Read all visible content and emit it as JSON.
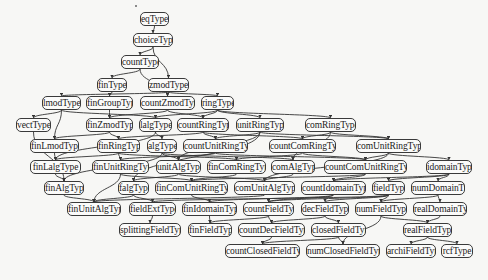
{
  "diagram": {
    "title": "",
    "style": {
      "background": "#f7f7f5",
      "node_border": "#3a3a3a",
      "edge_color": "#333333",
      "text_color": "#222222"
    },
    "nodes": [
      {
        "id": "eqType",
        "label": "eqType",
        "x": 140,
        "y": 12,
        "w": 29
      },
      {
        "id": "choiceType",
        "label": "choiceType",
        "x": 133,
        "y": 33,
        "w": 40
      },
      {
        "id": "countType",
        "label": "countType",
        "x": 121,
        "y": 55,
        "w": 38
      },
      {
        "id": "finType",
        "label": "finType",
        "x": 97,
        "y": 78,
        "w": 30
      },
      {
        "id": "zmodType",
        "label": "zmodType",
        "x": 148,
        "y": 78,
        "w": 41
      },
      {
        "id": "lmodType",
        "label": "lmodType",
        "x": 42,
        "y": 96,
        "w": 39
      },
      {
        "id": "finGroupType",
        "label": "finGroupType",
        "x": 86,
        "y": 96,
        "w": 47
      },
      {
        "id": "countZmodType",
        "label": "countZmodType",
        "x": 140,
        "y": 96,
        "w": 55
      },
      {
        "id": "ringType",
        "label": "ringType",
        "x": 201,
        "y": 96,
        "w": 33
      },
      {
        "id": "vectType",
        "label": "vectType",
        "x": 16,
        "y": 118,
        "w": 35
      },
      {
        "id": "finZmodType",
        "label": "finZmodType",
        "x": 86,
        "y": 118,
        "w": 47
      },
      {
        "id": "lalgType",
        "label": "lalgType",
        "x": 139,
        "y": 118,
        "w": 33
      },
      {
        "id": "countRingType",
        "label": "countRingType",
        "x": 177,
        "y": 118,
        "w": 52
      },
      {
        "id": "unitRingType",
        "label": "unitRingType",
        "x": 236,
        "y": 118,
        "w": 48
      },
      {
        "id": "comRingType",
        "label": "comRingType",
        "x": 305,
        "y": 118,
        "w": 51
      },
      {
        "id": "finLmodType",
        "label": "finLmodType",
        "x": 30,
        "y": 139,
        "w": 49
      },
      {
        "id": "finRingType",
        "label": "finRingType",
        "x": 97,
        "y": 139,
        "w": 43
      },
      {
        "id": "algType",
        "label": "algType",
        "x": 147,
        "y": 139,
        "w": 30
      },
      {
        "id": "countUnitRingType",
        "label": "countUnitRingType",
        "x": 183,
        "y": 139,
        "w": 65
      },
      {
        "id": "countComRingType",
        "label": "countComRingType",
        "x": 269,
        "y": 139,
        "w": 67
      },
      {
        "id": "comUnitRingType",
        "label": "comUnitRingType",
        "x": 356,
        "y": 139,
        "w": 65
      },
      {
        "id": "finLalgType",
        "label": "finLalgType",
        "x": 30,
        "y": 160,
        "w": 51
      },
      {
        "id": "finUnitRingType",
        "label": "finUnitRingType",
        "x": 92,
        "y": 160,
        "w": 57
      },
      {
        "id": "unitAlgType",
        "label": "unitAlgType",
        "x": 156,
        "y": 160,
        "w": 45
      },
      {
        "id": "finComRingType",
        "label": "finComRingType",
        "x": 207,
        "y": 160,
        "w": 59
      },
      {
        "id": "comAlgType",
        "label": "comAlgType",
        "x": 271,
        "y": 160,
        "w": 44
      },
      {
        "id": "countComUnitRingType",
        "label": "countComUnitRingType",
        "x": 324,
        "y": 160,
        "w": 83
      },
      {
        "id": "idomainType",
        "label": "idomainType",
        "x": 426,
        "y": 160,
        "w": 46
      },
      {
        "id": "finAlgType",
        "label": "finAlgType",
        "x": 44,
        "y": 181,
        "w": 40
      },
      {
        "id": "falgType",
        "label": "falgType",
        "x": 118,
        "y": 181,
        "w": 31
      },
      {
        "id": "finComUnitRingType",
        "label": "finComUnitRingType",
        "x": 155,
        "y": 181,
        "w": 73
      },
      {
        "id": "comUnitAlgType",
        "label": "comUnitAlgType",
        "x": 234,
        "y": 181,
        "w": 61
      },
      {
        "id": "countIdomainType",
        "label": "countIdomainType",
        "x": 301,
        "y": 181,
        "w": 65
      },
      {
        "id": "fieldType",
        "label": "fieldType",
        "x": 372,
        "y": 181,
        "w": 33
      },
      {
        "id": "numDomainType",
        "label": "numDomainType",
        "x": 411,
        "y": 181,
        "w": 54
      },
      {
        "id": "finUnitAlgType",
        "label": "finUnitAlgType",
        "x": 67,
        "y": 202,
        "w": 54
      },
      {
        "id": "fieldExtType",
        "label": "fieldExtType",
        "x": 129,
        "y": 202,
        "w": 47
      },
      {
        "id": "finIdomainType",
        "label": "finIdomainType",
        "x": 182,
        "y": 202,
        "w": 55
      },
      {
        "id": "countFieldType",
        "label": "countFieldType",
        "x": 243,
        "y": 202,
        "w": 51
      },
      {
        "id": "decFieldType",
        "label": "decFieldType",
        "x": 301,
        "y": 202,
        "w": 48
      },
      {
        "id": "numFieldType",
        "label": "numFieldType",
        "x": 355,
        "y": 202,
        "w": 52
      },
      {
        "id": "realDomainType",
        "label": "realDomainType",
        "x": 413,
        "y": 202,
        "w": 54
      },
      {
        "id": "splittingFieldType",
        "label": "splittingFieldType",
        "x": 119,
        "y": 223,
        "w": 62
      },
      {
        "id": "finFieldType",
        "label": "finFieldType",
        "x": 188,
        "y": 223,
        "w": 44
      },
      {
        "id": "countDecFieldType",
        "label": "countDecFieldType",
        "x": 238,
        "y": 223,
        "w": 67
      },
      {
        "id": "closedFieldType",
        "label": "closedFieldType",
        "x": 311,
        "y": 223,
        "w": 55
      },
      {
        "id": "realFieldType",
        "label": "realFieldType",
        "x": 403,
        "y": 223,
        "w": 49
      },
      {
        "id": "countClosedFieldType",
        "label": "countClosedFieldType",
        "x": 225,
        "y": 244,
        "w": 75
      },
      {
        "id": "numClosedFieldType",
        "label": "numClosedFieldType",
        "x": 306,
        "y": 244,
        "w": 74
      },
      {
        "id": "archiFieldType",
        "label": "archiFieldType",
        "x": 386,
        "y": 244,
        "w": 50
      },
      {
        "id": "rcfType",
        "label": "rcfType",
        "x": 441,
        "y": 244,
        "w": 32
      }
    ],
    "edges": [
      [
        "eqType",
        "choiceType"
      ],
      [
        "choiceType",
        "countType"
      ],
      [
        "choiceType",
        "zmodType"
      ],
      [
        "countType",
        "finType"
      ],
      [
        "countType",
        "countZmodType"
      ],
      [
        "zmodType",
        "lmodType"
      ],
      [
        "zmodType",
        "countZmodType"
      ],
      [
        "zmodType",
        "ringType"
      ],
      [
        "finType",
        "finGroupType"
      ],
      [
        "lmodType",
        "vectType"
      ],
      [
        "lmodType",
        "lalgType"
      ],
      [
        "lmodType",
        "finLmodType"
      ],
      [
        "finGroupType",
        "finZmodType"
      ],
      [
        "countZmodType",
        "finZmodType"
      ],
      [
        "countZmodType",
        "countRingType"
      ],
      [
        "ringType",
        "lalgType"
      ],
      [
        "ringType",
        "countRingType"
      ],
      [
        "ringType",
        "unitRingType"
      ],
      [
        "ringType",
        "comRingType"
      ],
      [
        "vectType",
        "finAlgType"
      ],
      [
        "finZmodType",
        "finLmodType"
      ],
      [
        "finZmodType",
        "finRingType"
      ],
      [
        "lalgType",
        "algType"
      ],
      [
        "lalgType",
        "finLalgType"
      ],
      [
        "countRingType",
        "finRingType"
      ],
      [
        "countRingType",
        "countUnitRingType"
      ],
      [
        "countRingType",
        "countComRingType"
      ],
      [
        "unitRingType",
        "countUnitRingType"
      ],
      [
        "unitRingType",
        "unitAlgType"
      ],
      [
        "unitRingType",
        "comUnitRingType"
      ],
      [
        "unitRingType",
        "falgType"
      ],
      [
        "comRingType",
        "countComRingType"
      ],
      [
        "comRingType",
        "comUnitRingType"
      ],
      [
        "comRingType",
        "comAlgType"
      ],
      [
        "finLmodType",
        "finLalgType"
      ],
      [
        "finRingType",
        "finUnitRingType"
      ],
      [
        "finRingType",
        "finComRingType"
      ],
      [
        "finRingType",
        "finLalgType"
      ],
      [
        "algType",
        "unitAlgType"
      ],
      [
        "algType",
        "comAlgType"
      ],
      [
        "algType",
        "finAlgType"
      ],
      [
        "countUnitRingType",
        "finUnitRingType"
      ],
      [
        "countUnitRingType",
        "countComUnitRingType"
      ],
      [
        "countComRingType",
        "finComRingType"
      ],
      [
        "countComRingType",
        "countComUnitRingType"
      ],
      [
        "comUnitRingType",
        "countComUnitRingType"
      ],
      [
        "comUnitRingType",
        "idomainType"
      ],
      [
        "comUnitRingType",
        "comUnitAlgType"
      ],
      [
        "finLalgType",
        "finAlgType"
      ],
      [
        "finUnitRingType",
        "finComUnitRingType"
      ],
      [
        "finUnitRingType",
        "finUnitAlgType"
      ],
      [
        "unitAlgType",
        "falgType"
      ],
      [
        "unitAlgType",
        "comUnitAlgType"
      ],
      [
        "finComRingType",
        "finComUnitRingType"
      ],
      [
        "comAlgType",
        "comUnitAlgType"
      ],
      [
        "countComUnitRingType",
        "countIdomainType"
      ],
      [
        "countComUnitRingType",
        "finComUnitRingType"
      ],
      [
        "idomainType",
        "countIdomainType"
      ],
      [
        "idomainType",
        "fieldType"
      ],
      [
        "idomainType",
        "numDomainType"
      ],
      [
        "finAlgType",
        "finUnitAlgType"
      ],
      [
        "falgType",
        "finUnitAlgType"
      ],
      [
        "falgType",
        "fieldExtType"
      ],
      [
        "finComUnitRingType",
        "finIdomainType"
      ],
      [
        "comUnitAlgType",
        "finUnitAlgType"
      ],
      [
        "countIdomainType",
        "finIdomainType"
      ],
      [
        "countIdomainType",
        "countFieldType"
      ],
      [
        "fieldType",
        "fieldExtType"
      ],
      [
        "fieldType",
        "countFieldType"
      ],
      [
        "fieldType",
        "decFieldType"
      ],
      [
        "fieldType",
        "numFieldType"
      ],
      [
        "numDomainType",
        "numFieldType"
      ],
      [
        "numDomainType",
        "realDomainType"
      ],
      [
        "fieldExtType",
        "splittingFieldType"
      ],
      [
        "finIdomainType",
        "finFieldType"
      ],
      [
        "countFieldType",
        "finFieldType"
      ],
      [
        "countFieldType",
        "countDecFieldType"
      ],
      [
        "decFieldType",
        "countDecFieldType"
      ],
      [
        "decFieldType",
        "closedFieldType"
      ],
      [
        "numFieldType",
        "realFieldType"
      ],
      [
        "numFieldType",
        "numClosedFieldType"
      ],
      [
        "realDomainType",
        "realFieldType"
      ],
      [
        "countDecFieldType",
        "countClosedFieldType"
      ],
      [
        "closedFieldType",
        "countClosedFieldType"
      ],
      [
        "closedFieldType",
        "numClosedFieldType"
      ],
      [
        "realFieldType",
        "archiFieldType"
      ],
      [
        "realFieldType",
        "rcfType"
      ]
    ]
  }
}
